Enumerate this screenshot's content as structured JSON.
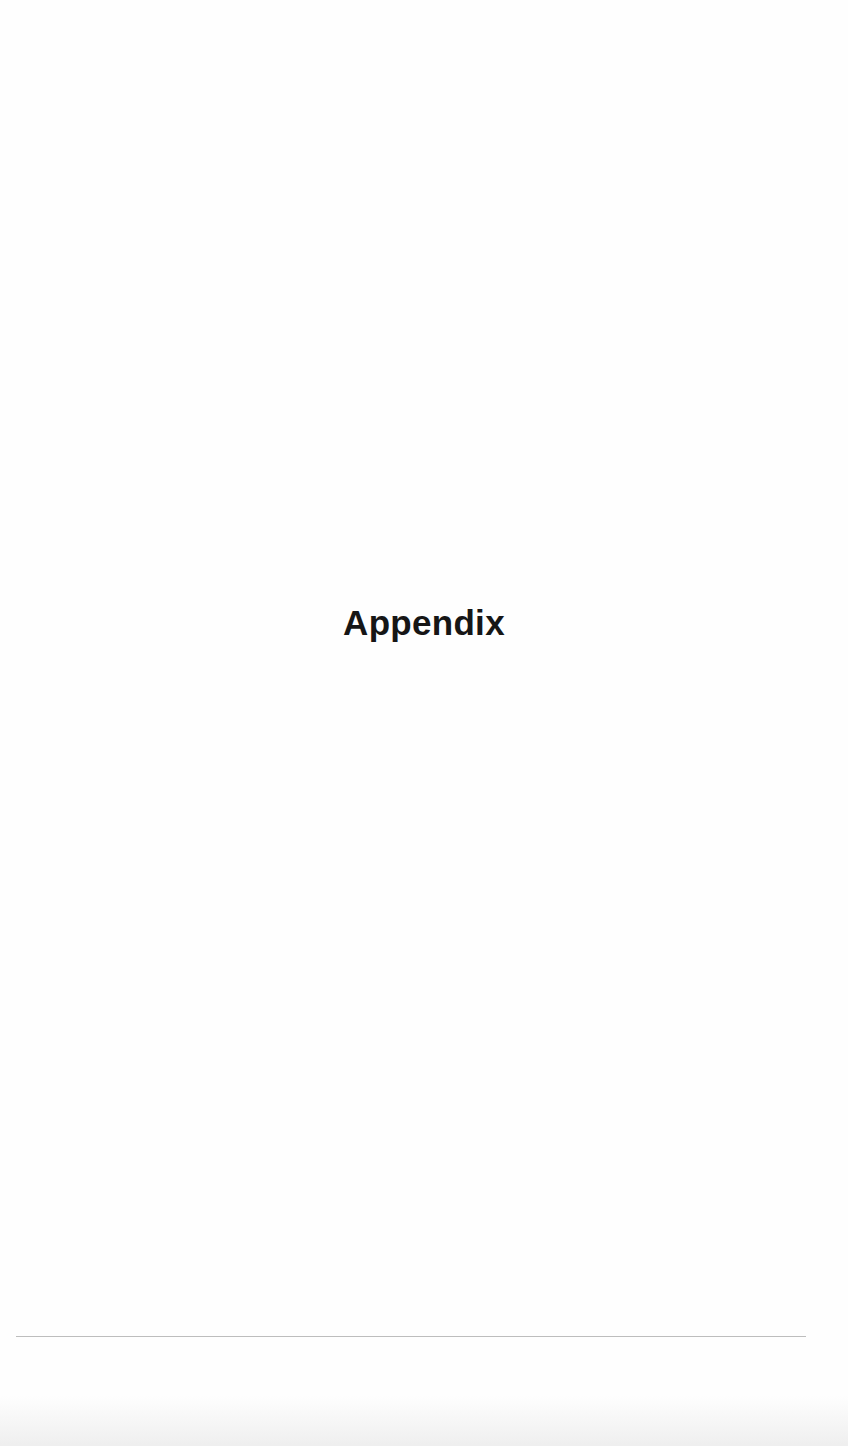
{
  "page": {
    "heading": "Appendix",
    "colors": {
      "background": "#fefefe",
      "heading_text": "#161616",
      "rule": "#bdbdbd"
    }
  }
}
